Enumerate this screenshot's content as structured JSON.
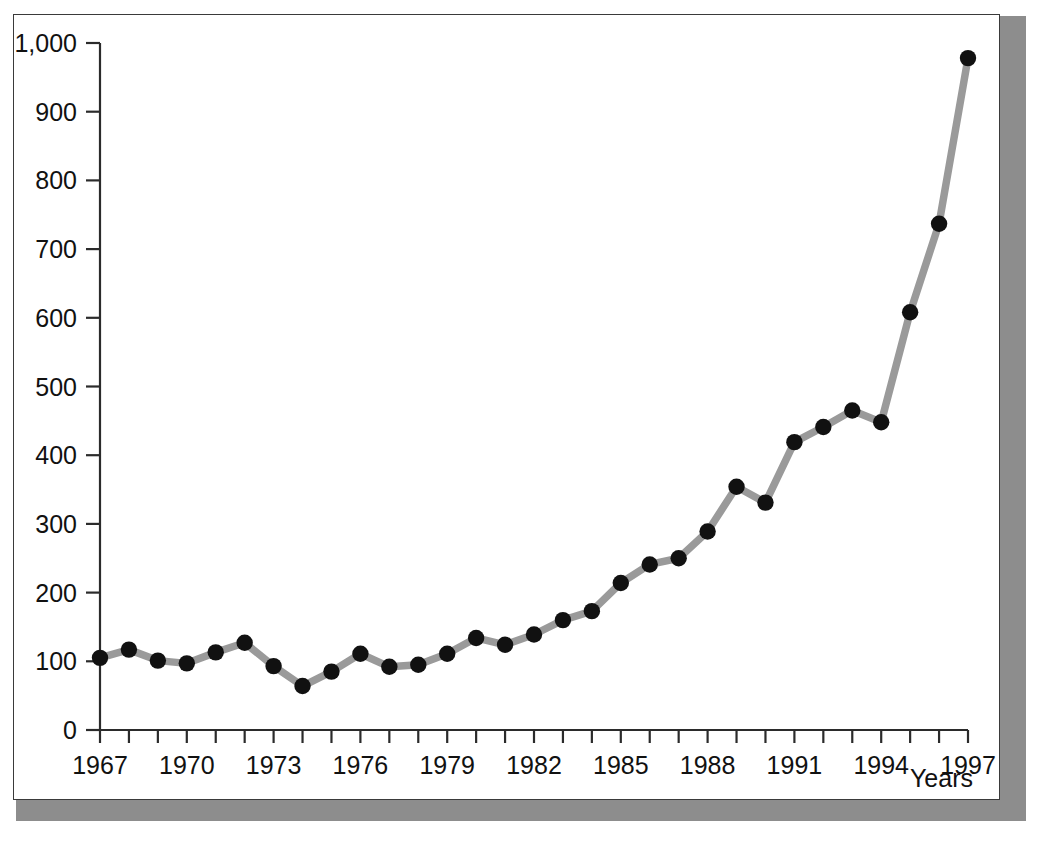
{
  "figure": {
    "caption": "",
    "frame_color": "#3a3a3a",
    "shadow_color": "#8d8d8d",
    "background_color": "#ffffff"
  },
  "chart_data": {
    "type": "line",
    "title": "",
    "subtitle": "",
    "xlabel": "Years",
    "ylabel": "",
    "xlim": [
      1967,
      1997
    ],
    "ylim": [
      0,
      1000
    ],
    "grid": false,
    "legend": null,
    "line_color": "#9a9a9a",
    "marker_color": "#111111",
    "marker_shape": "circle",
    "x_tick_labels": [
      "1967",
      "1970",
      "1973",
      "1976",
      "1979",
      "1982",
      "1985",
      "1988",
      "1991",
      "1994",
      "1997"
    ],
    "x_tick_label_years": [
      1967,
      1970,
      1973,
      1976,
      1979,
      1982,
      1985,
      1988,
      1991,
      1994,
      1997
    ],
    "x_minor_ticks_every": 1,
    "y_tick_labels": [
      "0",
      "100",
      "200",
      "300",
      "400",
      "500",
      "600",
      "700",
      "800",
      "900",
      "1,000"
    ],
    "y_tick_values": [
      0,
      100,
      200,
      300,
      400,
      500,
      600,
      700,
      800,
      900,
      1000
    ],
    "x": [
      1967,
      1968,
      1969,
      1970,
      1971,
      1972,
      1973,
      1974,
      1975,
      1976,
      1977,
      1978,
      1979,
      1980,
      1981,
      1982,
      1983,
      1984,
      1985,
      1986,
      1987,
      1988,
      1989,
      1990,
      1991,
      1992,
      1993,
      1994,
      1995,
      1996,
      1997
    ],
    "values": [
      105,
      117,
      101,
      97,
      113,
      127,
      93,
      64,
      85,
      111,
      92,
      95,
      111,
      134,
      124,
      139,
      160,
      173,
      214,
      241,
      250,
      289,
      354,
      331,
      419,
      441,
      465,
      448,
      608,
      737,
      978
    ],
    "series": [
      {
        "name": "",
        "values": [
          105,
          117,
          101,
          97,
          113,
          127,
          93,
          64,
          85,
          111,
          92,
          95,
          111,
          134,
          124,
          139,
          160,
          173,
          214,
          241,
          250,
          289,
          354,
          331,
          419,
          441,
          465,
          448,
          608,
          737,
          978
        ]
      }
    ]
  }
}
